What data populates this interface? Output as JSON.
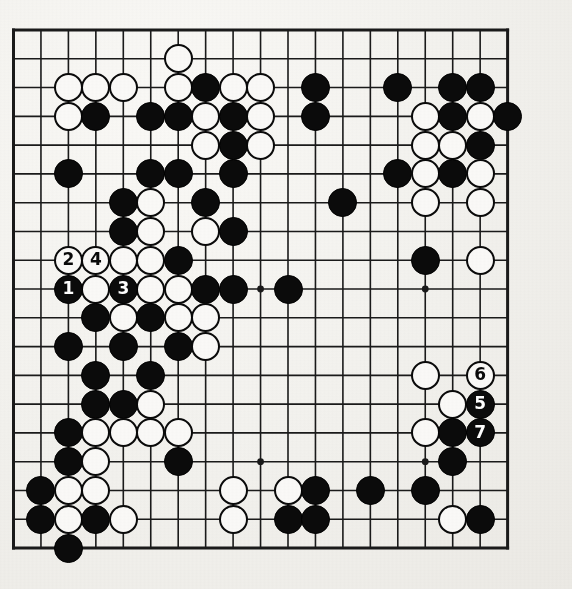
{
  "diagram": {
    "kind": "go-board-diagram",
    "board_size": 19,
    "title": "",
    "caption": "",
    "geometry": {
      "origin_x": 13.5,
      "origin_y": 30.0,
      "step_x": 27.45,
      "step_y": 28.78,
      "stone_diameter": 29,
      "line_width": 1.6,
      "border_width": 3.0
    },
    "colors": {
      "paper": "#f3f2ee",
      "line": "#1a1a1a",
      "black_stone": "#0b0b0b",
      "white_stone": "#fbfaf8",
      "white_stone_edge": "#0a0a0a",
      "label_on_black": "#ffffff",
      "label_on_white": "#0a0a0a"
    },
    "hoshi": [
      {
        "col": 4,
        "row": 4
      },
      {
        "col": 10,
        "row": 4
      },
      {
        "col": 16,
        "row": 4
      },
      {
        "col": 4,
        "row": 10
      },
      {
        "col": 10,
        "row": 10
      },
      {
        "col": 16,
        "row": 10
      },
      {
        "col": 4,
        "row": 16
      },
      {
        "col": 10,
        "row": 16
      },
      {
        "col": 16,
        "row": 16
      }
    ],
    "move_numbers": [
      {
        "n": "1",
        "col": 3,
        "row": 10,
        "color": "black"
      },
      {
        "n": "2",
        "col": 3,
        "row": 9,
        "color": "white"
      },
      {
        "n": "3",
        "col": 5,
        "row": 10,
        "color": "black"
      },
      {
        "n": "4",
        "col": 4,
        "row": 9,
        "color": "white"
      },
      {
        "n": "5",
        "col": 18,
        "row": 14,
        "color": "black"
      },
      {
        "n": "6",
        "col": 18,
        "row": 13,
        "color": "white"
      },
      {
        "n": "7",
        "col": 18,
        "row": 15,
        "color": "black"
      }
    ],
    "stones": [
      {
        "col": 7,
        "row": 2,
        "color": "white"
      },
      {
        "col": 3,
        "row": 3,
        "color": "white"
      },
      {
        "col": 4,
        "row": 3,
        "color": "white"
      },
      {
        "col": 5,
        "row": 3,
        "color": "white"
      },
      {
        "col": 7,
        "row": 3,
        "color": "white"
      },
      {
        "col": 8,
        "row": 3,
        "color": "black"
      },
      {
        "col": 9,
        "row": 3,
        "color": "white"
      },
      {
        "col": 10,
        "row": 3,
        "color": "white"
      },
      {
        "col": 12,
        "row": 3,
        "color": "black"
      },
      {
        "col": 15,
        "row": 3,
        "color": "black"
      },
      {
        "col": 17,
        "row": 3,
        "color": "black"
      },
      {
        "col": 18,
        "row": 3,
        "color": "black"
      },
      {
        "col": 3,
        "row": 4,
        "color": "white"
      },
      {
        "col": 4,
        "row": 4,
        "color": "black"
      },
      {
        "col": 6,
        "row": 4,
        "color": "black"
      },
      {
        "col": 7,
        "row": 4,
        "color": "black"
      },
      {
        "col": 8,
        "row": 4,
        "color": "white"
      },
      {
        "col": 9,
        "row": 4,
        "color": "black"
      },
      {
        "col": 10,
        "row": 4,
        "color": "white"
      },
      {
        "col": 12,
        "row": 4,
        "color": "black"
      },
      {
        "col": 16,
        "row": 4,
        "color": "white"
      },
      {
        "col": 17,
        "row": 4,
        "color": "black"
      },
      {
        "col": 18,
        "row": 4,
        "color": "white"
      },
      {
        "col": 19,
        "row": 4,
        "color": "black"
      },
      {
        "col": 8,
        "row": 5,
        "color": "white"
      },
      {
        "col": 9,
        "row": 5,
        "color": "black"
      },
      {
        "col": 10,
        "row": 5,
        "color": "white"
      },
      {
        "col": 16,
        "row": 5,
        "color": "white"
      },
      {
        "col": 17,
        "row": 5,
        "color": "white"
      },
      {
        "col": 18,
        "row": 5,
        "color": "black"
      },
      {
        "col": 3,
        "row": 6,
        "color": "black"
      },
      {
        "col": 6,
        "row": 6,
        "color": "black"
      },
      {
        "col": 7,
        "row": 6,
        "color": "black"
      },
      {
        "col": 9,
        "row": 6,
        "color": "black"
      },
      {
        "col": 15,
        "row": 6,
        "color": "black"
      },
      {
        "col": 16,
        "row": 6,
        "color": "white"
      },
      {
        "col": 17,
        "row": 6,
        "color": "black"
      },
      {
        "col": 18,
        "row": 6,
        "color": "white"
      },
      {
        "col": 5,
        "row": 7,
        "color": "black"
      },
      {
        "col": 6,
        "row": 7,
        "color": "white"
      },
      {
        "col": 8,
        "row": 7,
        "color": "black"
      },
      {
        "col": 13,
        "row": 7,
        "color": "black"
      },
      {
        "col": 16,
        "row": 7,
        "color": "white"
      },
      {
        "col": 18,
        "row": 7,
        "color": "white"
      },
      {
        "col": 5,
        "row": 8,
        "color": "black"
      },
      {
        "col": 6,
        "row": 8,
        "color": "white"
      },
      {
        "col": 8,
        "row": 8,
        "color": "white"
      },
      {
        "col": 9,
        "row": 8,
        "color": "black"
      },
      {
        "col": 5,
        "row": 9,
        "color": "white"
      },
      {
        "col": 6,
        "row": 9,
        "color": "white"
      },
      {
        "col": 7,
        "row": 9,
        "color": "black"
      },
      {
        "col": 16,
        "row": 9,
        "color": "black"
      },
      {
        "col": 18,
        "row": 9,
        "color": "white"
      },
      {
        "col": 4,
        "row": 10,
        "color": "white"
      },
      {
        "col": 6,
        "row": 10,
        "color": "white"
      },
      {
        "col": 7,
        "row": 10,
        "color": "white"
      },
      {
        "col": 8,
        "row": 10,
        "color": "black"
      },
      {
        "col": 9,
        "row": 10,
        "color": "black"
      },
      {
        "col": 11,
        "row": 10,
        "color": "black"
      },
      {
        "col": 4,
        "row": 11,
        "color": "black"
      },
      {
        "col": 5,
        "row": 11,
        "color": "white"
      },
      {
        "col": 6,
        "row": 11,
        "color": "black"
      },
      {
        "col": 7,
        "row": 11,
        "color": "white"
      },
      {
        "col": 8,
        "row": 11,
        "color": "white"
      },
      {
        "col": 3,
        "row": 12,
        "color": "black"
      },
      {
        "col": 5,
        "row": 12,
        "color": "black"
      },
      {
        "col": 7,
        "row": 12,
        "color": "black"
      },
      {
        "col": 8,
        "row": 12,
        "color": "white"
      },
      {
        "col": 4,
        "row": 13,
        "color": "black"
      },
      {
        "col": 6,
        "row": 13,
        "color": "black"
      },
      {
        "col": 16,
        "row": 13,
        "color": "white"
      },
      {
        "col": 4,
        "row": 14,
        "color": "black"
      },
      {
        "col": 5,
        "row": 14,
        "color": "black"
      },
      {
        "col": 6,
        "row": 14,
        "color": "white"
      },
      {
        "col": 17,
        "row": 14,
        "color": "white"
      },
      {
        "col": 3,
        "row": 15,
        "color": "black"
      },
      {
        "col": 4,
        "row": 15,
        "color": "white"
      },
      {
        "col": 5,
        "row": 15,
        "color": "white"
      },
      {
        "col": 6,
        "row": 15,
        "color": "white"
      },
      {
        "col": 7,
        "row": 15,
        "color": "white"
      },
      {
        "col": 16,
        "row": 15,
        "color": "white"
      },
      {
        "col": 17,
        "row": 15,
        "color": "black"
      },
      {
        "col": 3,
        "row": 16,
        "color": "black"
      },
      {
        "col": 4,
        "row": 16,
        "color": "white"
      },
      {
        "col": 7,
        "row": 16,
        "color": "black"
      },
      {
        "col": 17,
        "row": 16,
        "color": "black"
      },
      {
        "col": 2,
        "row": 17,
        "color": "black"
      },
      {
        "col": 3,
        "row": 17,
        "color": "white"
      },
      {
        "col": 4,
        "row": 17,
        "color": "white"
      },
      {
        "col": 9,
        "row": 17,
        "color": "white"
      },
      {
        "col": 11,
        "row": 17,
        "color": "white"
      },
      {
        "col": 12,
        "row": 17,
        "color": "black"
      },
      {
        "col": 14,
        "row": 17,
        "color": "black"
      },
      {
        "col": 16,
        "row": 17,
        "color": "black"
      },
      {
        "col": 2,
        "row": 18,
        "color": "black"
      },
      {
        "col": 3,
        "row": 18,
        "color": "white"
      },
      {
        "col": 4,
        "row": 18,
        "color": "black"
      },
      {
        "col": 5,
        "row": 18,
        "color": "white"
      },
      {
        "col": 9,
        "row": 18,
        "color": "white"
      },
      {
        "col": 11,
        "row": 18,
        "color": "black"
      },
      {
        "col": 12,
        "row": 18,
        "color": "black"
      },
      {
        "col": 17,
        "row": 18,
        "color": "white"
      },
      {
        "col": 18,
        "row": 18,
        "color": "black"
      },
      {
        "col": 3,
        "row": 19,
        "color": "black"
      }
    ]
  }
}
